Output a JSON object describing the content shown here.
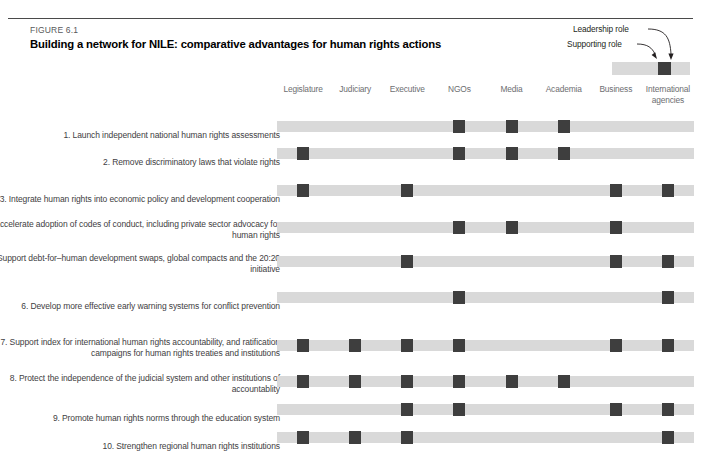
{
  "figure": {
    "number": "FIGURE 6.1",
    "title": "Building a network for NILE: comparative advantages for human rights actions"
  },
  "legend": {
    "leadership_label": "Leadership role",
    "supporting_label": "Supporting role",
    "supporting_color": "#d9d9d9",
    "leadership_color": "#3e3e3e"
  },
  "chart_data": {
    "type": "heatmap",
    "title": "Building a network for NILE: comparative advantages for human rights actions",
    "xlabel": "",
    "ylabel": "",
    "legend_position": "top-right",
    "grid": false,
    "value_meaning": {
      "0": "Supporting role",
      "1": "Leadership role"
    },
    "categories": [
      "Legislature",
      "Judiciary",
      "Executive",
      "NGOs",
      "Media",
      "Academia",
      "Business",
      "International agencies"
    ],
    "rows": [
      {
        "label": "1. Launch independent national human rights assessments",
        "values": [
          0,
          0,
          0,
          1,
          1,
          1,
          0,
          0
        ]
      },
      {
        "label": "2. Remove discriminatory laws that violate rights",
        "values": [
          1,
          0,
          0,
          1,
          1,
          1,
          0,
          0
        ]
      },
      {
        "label": "3. Integrate human rights into economic policy and development cooperation",
        "values": [
          1,
          0,
          1,
          0,
          0,
          0,
          1,
          1
        ]
      },
      {
        "label": "4. Accelerate adoption of codes of conduct, including private sector advocacy for human rights",
        "values": [
          0,
          0,
          0,
          1,
          1,
          0,
          1,
          0
        ]
      },
      {
        "label": "5. Support debt-for–human development swaps, global compacts and the 20:20 initiative",
        "values": [
          0,
          0,
          1,
          0,
          0,
          0,
          1,
          1
        ]
      },
      {
        "label": "6. Develop more effective early warning systems for conflict prevention",
        "values": [
          0,
          0,
          0,
          1,
          0,
          0,
          0,
          1
        ]
      },
      {
        "label": "7. Support index for international human rights accountability, and ratification campaigns for human rights treaties and institutions",
        "values": [
          1,
          1,
          1,
          1,
          0,
          0,
          1,
          1
        ]
      },
      {
        "label": "8. Protect the independence of the judicial system and other institutions of accountablity",
        "values": [
          1,
          1,
          1,
          1,
          1,
          1,
          0,
          0
        ]
      },
      {
        "label": "9. Promote human rights norms through the education system",
        "values": [
          0,
          0,
          1,
          1,
          0,
          0,
          1,
          1
        ]
      },
      {
        "label": "10. Strengthen regional human rights institutions",
        "values": [
          1,
          1,
          1,
          0,
          0,
          0,
          0,
          1
        ]
      }
    ]
  }
}
